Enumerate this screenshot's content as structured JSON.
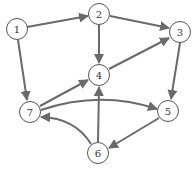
{
  "diagram": {
    "type": "directed-graph",
    "edge_color": "#6a6a6a",
    "node_stroke": "#555555",
    "nodes": [
      {
        "id": "1",
        "label": "1",
        "x": 17,
        "y": 29
      },
      {
        "id": "2",
        "label": "2",
        "x": 99,
        "y": 14
      },
      {
        "id": "3",
        "label": "3",
        "x": 180,
        "y": 32
      },
      {
        "id": "4",
        "label": "4",
        "x": 99,
        "y": 75
      },
      {
        "id": "5",
        "label": "5",
        "x": 168,
        "y": 111
      },
      {
        "id": "6",
        "label": "6",
        "x": 98,
        "y": 153
      },
      {
        "id": "7",
        "label": "7",
        "x": 30,
        "y": 112
      }
    ],
    "edges": [
      {
        "from": "1",
        "to": "2"
      },
      {
        "from": "2",
        "to": "3"
      },
      {
        "from": "2",
        "to": "4"
      },
      {
        "from": "4",
        "to": "3"
      },
      {
        "from": "1",
        "to": "7"
      },
      {
        "from": "3",
        "to": "5"
      },
      {
        "from": "7",
        "to": "4"
      },
      {
        "from": "7",
        "to": "5",
        "curved": true
      },
      {
        "from": "5",
        "to": "6"
      },
      {
        "from": "6",
        "to": "7",
        "curved": true
      },
      {
        "from": "6",
        "to": "4"
      }
    ]
  }
}
